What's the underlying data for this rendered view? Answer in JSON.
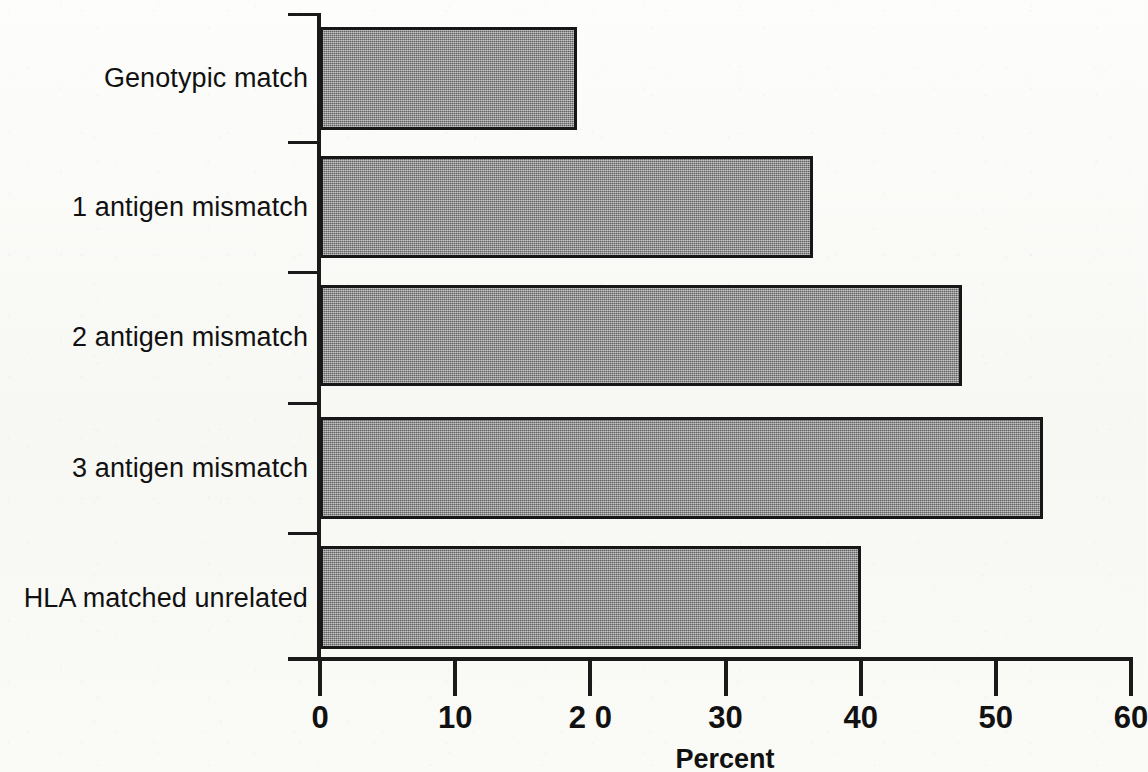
{
  "chart_data": {
    "type": "bar",
    "orientation": "horizontal",
    "title": "",
    "subtitle": "",
    "xlabel": "Percent",
    "ylabel": "",
    "categories": [
      "Genotypic match",
      "1 antigen mismatch",
      "2 antigen mismatch",
      "3 antigen mismatch",
      "HLA matched unrelated"
    ],
    "values": [
      19,
      36.5,
      47.5,
      53.5,
      40
    ],
    "xlim": [
      0,
      60
    ],
    "xticks": [
      0,
      10,
      20,
      30,
      40,
      50,
      60
    ],
    "xtick_labels": [
      "0",
      "10",
      "2 0",
      "30",
      "40",
      "50",
      "60"
    ],
    "grid": false,
    "legend": null,
    "series": [
      {
        "name": "Percent",
        "values": [
          19,
          36.5,
          47.5,
          53.5,
          40
        ]
      }
    ],
    "colors": {
      "bar_fill": "#8b8b8b",
      "bar_border": "#171717",
      "axis": "#1a1a1a",
      "text": "#111111",
      "background": "#fbfbf9"
    }
  }
}
